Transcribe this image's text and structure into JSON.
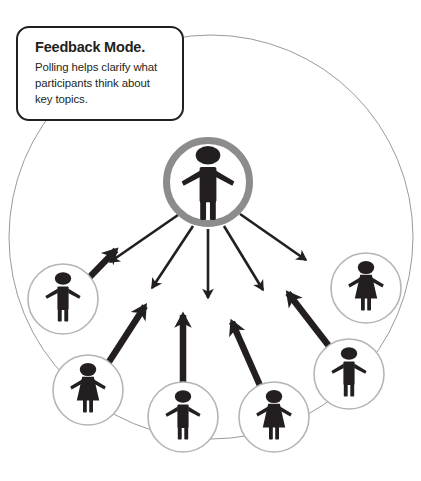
{
  "callout": {
    "title": "Feedback Mode.",
    "body": "Polling helps clarify what participants think about key topics."
  },
  "colors": {
    "figure": "#231f20",
    "center_ring": "#8c8c8c",
    "node_ring": "#b5b5b5",
    "outer_circle": "#9a9a9a",
    "callout_border": "#231f20",
    "background": "#ffffff"
  },
  "diagram": {
    "type": "hub-and-spoke-network",
    "outer_circle": {
      "cx": 211,
      "cy": 237,
      "r": 202,
      "stroke_width": 1
    },
    "center_node": {
      "id": "presenter",
      "label": "presenter",
      "gender": "male",
      "cx": 208,
      "cy": 182,
      "r": 45,
      "ring_width": 7,
      "ring_color": "#8c8c8c"
    },
    "participant_nodes": [
      {
        "id": "participant-left-upper",
        "gender": "male",
        "cx": 63,
        "cy": 299,
        "r": 35
      },
      {
        "id": "participant-left-lower",
        "gender": "female",
        "cx": 88,
        "cy": 390,
        "r": 35
      },
      {
        "id": "participant-bottom-left",
        "gender": "male",
        "cx": 183,
        "cy": 417,
        "r": 35
      },
      {
        "id": "participant-bottom-right",
        "gender": "female",
        "cx": 274,
        "cy": 417,
        "r": 35
      },
      {
        "id": "participant-right-lower",
        "gender": "male",
        "cx": 349,
        "cy": 374,
        "r": 35
      },
      {
        "id": "participant-right-upper",
        "gender": "female",
        "cx": 366,
        "cy": 288,
        "r": 35
      }
    ],
    "outbound_arrows": {
      "description": "thin arrows broadcasting outward from presenter",
      "count": 5,
      "stroke_width": 2.6,
      "angles_deg": [
        128,
        105,
        90,
        72,
        50
      ]
    },
    "inbound_arrows": {
      "description": "thick arrows feeding back from participants to presenter",
      "count": 5,
      "stroke_width": 6.5,
      "from": [
        "participant-left-upper",
        "participant-left-lower",
        "participant-bottom-left",
        "participant-bottom-right",
        "participant-right-lower"
      ]
    }
  }
}
